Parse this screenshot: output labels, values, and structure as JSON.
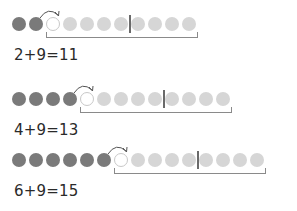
{
  "colors": {
    "counted": "#7a7a7a",
    "open": "#ffffff",
    "remaining": "#d6d6d6",
    "divider": "#6a6a6a",
    "bracket": "#8a8a8a"
  },
  "rows": [
    {
      "first_addend": 2,
      "second_addend": 9,
      "sum": 11,
      "equation": "2+9=11"
    },
    {
      "first_addend": 4,
      "second_addend": 9,
      "sum": 13,
      "equation": "4+9=13"
    },
    {
      "first_addend": 6,
      "second_addend": 9,
      "sum": 15,
      "equation": "6+9=15"
    }
  ]
}
